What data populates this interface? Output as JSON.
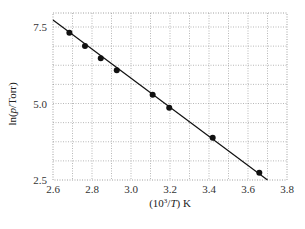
{
  "chart_data": {
    "type": "scatter",
    "title": "",
    "xlabel": "(10^3/T) K",
    "ylabel": "ln(p/Torr)",
    "xlim": [
      2.6,
      3.8
    ],
    "ylim": [
      2.5,
      7.95
    ],
    "x_ticks": [
      "2.6",
      "2.8",
      "3.0",
      "3.2",
      "3.4",
      "3.6",
      "3.8"
    ],
    "y_ticks": [
      "2.5",
      "5.0",
      "7.5"
    ],
    "grid": true,
    "grid_style": "dotted",
    "legend": null,
    "series": [
      {
        "name": "data",
        "marker": "filled-circle",
        "x": [
          2.684,
          2.764,
          2.845,
          2.927,
          3.111,
          3.196,
          3.419,
          3.658
        ],
        "y": [
          7.31,
          6.88,
          6.48,
          6.09,
          5.29,
          4.86,
          3.88,
          2.74
        ]
      },
      {
        "name": "linear-fit",
        "line": "solid",
        "x": [
          2.6,
          3.7
        ],
        "y": [
          7.73,
          2.5
        ]
      }
    ]
  },
  "labels": {
    "xlabel_main": "(10",
    "xlabel_sup": "3",
    "xlabel_rest": "/",
    "xlabel_T": "T",
    "xlabel_end": ") K",
    "ylabel_pre": "ln(",
    "ylabel_p": "p",
    "ylabel_post": "/Torr)"
  }
}
